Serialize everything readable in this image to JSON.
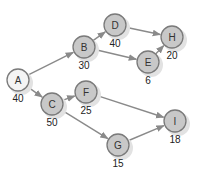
{
  "diagram": {
    "type": "network-graph",
    "colors": {
      "edge": "#8a8a8a",
      "node_fill": "#c8c8c8",
      "start_node_fill": "#f4f4f4",
      "node_stroke": "#7a7a7a",
      "shadow": "#e2e2e2"
    },
    "nodes": [
      {
        "id": "A",
        "label": "A",
        "weight": "40",
        "x": 18,
        "y": 80,
        "start": true
      },
      {
        "id": "B",
        "label": "B",
        "weight": "30",
        "x": 84,
        "y": 47
      },
      {
        "id": "C",
        "label": "C",
        "weight": "50",
        "x": 52,
        "y": 104
      },
      {
        "id": "D",
        "label": "D",
        "weight": "40",
        "x": 115,
        "y": 25
      },
      {
        "id": "E",
        "label": "E",
        "weight": "6",
        "x": 148,
        "y": 62
      },
      {
        "id": "F",
        "label": "F",
        "weight": "25",
        "x": 86,
        "y": 92
      },
      {
        "id": "G",
        "label": "G",
        "weight": "15",
        "x": 118,
        "y": 145
      },
      {
        "id": "H",
        "label": "H",
        "weight": "20",
        "x": 172,
        "y": 37
      },
      {
        "id": "I",
        "label": "I",
        "weight": "18",
        "x": 175,
        "y": 121
      }
    ],
    "edges": [
      {
        "from": "A",
        "to": "B"
      },
      {
        "from": "A",
        "to": "C"
      },
      {
        "from": "B",
        "to": "D"
      },
      {
        "from": "B",
        "to": "E"
      },
      {
        "from": "D",
        "to": "H"
      },
      {
        "from": "E",
        "to": "H"
      },
      {
        "from": "C",
        "to": "F"
      },
      {
        "from": "C",
        "to": "G"
      },
      {
        "from": "F",
        "to": "I"
      },
      {
        "from": "G",
        "to": "I"
      }
    ]
  }
}
